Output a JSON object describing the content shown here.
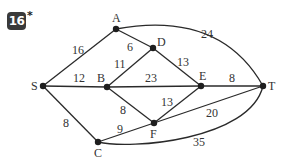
{
  "problem": {
    "number": "16",
    "marker": "*"
  },
  "graph": {
    "nodes": [
      {
        "id": "S",
        "label": "S",
        "x": 43,
        "y": 86
      },
      {
        "id": "A",
        "label": "A",
        "x": 116,
        "y": 29
      },
      {
        "id": "B",
        "label": "B",
        "x": 107,
        "y": 87
      },
      {
        "id": "C",
        "label": "C",
        "x": 98,
        "y": 142
      },
      {
        "id": "D",
        "label": "D",
        "x": 153,
        "y": 48
      },
      {
        "id": "E",
        "label": "E",
        "x": 201,
        "y": 86
      },
      {
        "id": "F",
        "label": "F",
        "x": 154,
        "y": 123
      },
      {
        "id": "T",
        "label": "T",
        "x": 263,
        "y": 86
      }
    ],
    "edges": [
      {
        "from": "S",
        "to": "A",
        "weight": "16"
      },
      {
        "from": "S",
        "to": "B",
        "weight": "12"
      },
      {
        "from": "S",
        "to": "C",
        "weight": "8"
      },
      {
        "from": "A",
        "to": "D",
        "weight": "6"
      },
      {
        "from": "A",
        "to": "T",
        "weight": "24"
      },
      {
        "from": "B",
        "to": "D",
        "weight": "11"
      },
      {
        "from": "B",
        "to": "E",
        "weight": "23"
      },
      {
        "from": "B",
        "to": "F",
        "weight": "8"
      },
      {
        "from": "D",
        "to": "E",
        "weight": "13"
      },
      {
        "from": "E",
        "to": "F",
        "weight": "13"
      },
      {
        "from": "E",
        "to": "T",
        "weight": "8"
      },
      {
        "from": "C",
        "to": "F",
        "weight": "9"
      },
      {
        "from": "F",
        "to": "T",
        "weight": "20"
      },
      {
        "from": "C",
        "to": "T",
        "weight": "35"
      }
    ]
  }
}
